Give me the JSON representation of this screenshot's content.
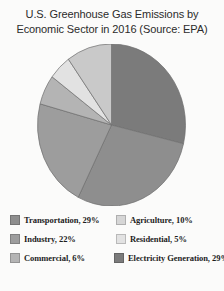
{
  "chart_data": {
    "type": "pie",
    "title": "U.S. Greenhouse Gas Emissions by Economic Sector in 2016 (Source: EPA)",
    "title_lines": [
      "U.S. Greenhouse Gas Emissions by",
      "Economic Sector in 2016 (Source: EPA)"
    ],
    "categories": [
      "Electricity Generation",
      "Transportation",
      "Industry",
      "Commercial",
      "Residential",
      "Agriculture"
    ],
    "values": [
      29,
      29,
      22,
      6,
      5,
      10
    ],
    "units": "%",
    "xlabel": "",
    "ylabel": "",
    "legend_position": "bottom",
    "grid": false,
    "start_angle_deg": 0,
    "direction": "clockwise",
    "slices": [
      {
        "label": "Electricity Generation",
        "value": 29,
        "display": "29%",
        "color": "#7b7b7b"
      },
      {
        "label": "Transportation",
        "value": 29,
        "display": "29%",
        "color": "#8e8e8e"
      },
      {
        "label": "Industry",
        "value": 22,
        "display": "22%",
        "color": "#9d9d9d"
      },
      {
        "label": "Commercial",
        "value": 6,
        "display": "6%",
        "color": "#b4b4b4"
      },
      {
        "label": "Residential",
        "value": 5,
        "display": "5%",
        "color": "#e2e2e2"
      },
      {
        "label": "Agriculture",
        "value": 10,
        "display": "10%",
        "color": "#c9c9c9"
      }
    ]
  },
  "legend": {
    "rows": [
      {
        "left": {
          "label": "Transportation, 29%",
          "color": "#8e8e8e"
        },
        "right": {
          "label": "Agriculture, 10%",
          "color": "#d6d6d6"
        }
      },
      {
        "left": {
          "label": "Industry, 22%",
          "color": "#9d9d9d"
        },
        "right": {
          "label": "Residential, 5%",
          "color": "#e2e2e2"
        }
      },
      {
        "left": {
          "label": "Commercial, 6%",
          "color": "#b4b4b4"
        },
        "right": {
          "label": "Electricity Generation, 29%",
          "color": "#7b7b7b"
        }
      }
    ]
  },
  "colors": {
    "background": "#fbfbfa",
    "title_text": "#2b2b2b",
    "legend_text": "#1d1d1d",
    "slice_outline": "#6f6f6f"
  }
}
